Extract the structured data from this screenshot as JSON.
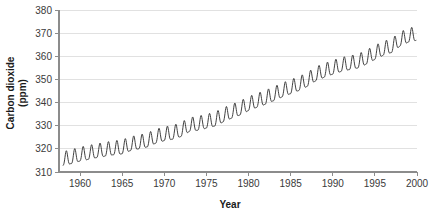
{
  "chart_data": {
    "type": "line",
    "title": "",
    "xlabel": "Year",
    "ylabel_line1": "Carbon dioxide",
    "ylabel_line2": "(ppm)",
    "xlim": [
      1957.5,
      2000.0
    ],
    "ylim": [
      310,
      380
    ],
    "xticks": [
      1960,
      1965,
      1970,
      1975,
      1980,
      1985,
      1990,
      1995,
      2000
    ],
    "xtick_labels": [
      "1960",
      "1965",
      "1970",
      "1975",
      "1980",
      "1985",
      "1990",
      "1995",
      "2000"
    ],
    "yticks": [
      310,
      320,
      330,
      340,
      350,
      360,
      370,
      380
    ],
    "ytick_labels": [
      "310",
      "320",
      "330",
      "340",
      "350",
      "360",
      "370",
      "380"
    ],
    "grid": "horizontal",
    "legend": "none",
    "line_color": "#2b2b2b",
    "grid_color": "#d9d9d9",
    "axis_color": "#8c8c8c",
    "series_name": "Atmospheric CO2 concentration",
    "seasonal_amplitude_ppm": 3.0,
    "annual_trend": {
      "x": [
        1958.0,
        1959.0,
        1960.0,
        1961.0,
        1962.0,
        1963.0,
        1964.0,
        1965.0,
        1966.0,
        1967.0,
        1968.0,
        1969.0,
        1970.0,
        1971.0,
        1972.0,
        1973.0,
        1974.0,
        1975.0,
        1976.0,
        1977.0,
        1978.0,
        1979.0,
        1980.0,
        1981.0,
        1982.0,
        1983.0,
        1984.0,
        1985.0,
        1986.0,
        1987.0,
        1988.0,
        1989.0,
        1990.0,
        1991.0,
        1992.0,
        1993.0,
        1994.0,
        1995.0,
        1996.0,
        1997.0,
        1998.0,
        1999.0,
        1999.9
      ],
      "y": [
        315.0,
        315.8,
        316.9,
        317.6,
        318.4,
        319.0,
        319.6,
        320.0,
        321.4,
        322.2,
        323.0,
        324.6,
        325.7,
        326.3,
        327.5,
        329.7,
        330.2,
        331.1,
        332.0,
        333.8,
        335.4,
        336.8,
        338.7,
        340.1,
        341.4,
        343.0,
        344.6,
        346.0,
        347.4,
        349.2,
        351.6,
        353.1,
        354.4,
        355.6,
        356.4,
        357.1,
        358.8,
        360.8,
        362.6,
        363.8,
        366.6,
        368.3,
        369.0
      ]
    },
    "annotations": []
  },
  "axis_titles": {
    "x": "Year",
    "y_line1": "Carbon dioxide",
    "y_line2": "(ppm)"
  }
}
